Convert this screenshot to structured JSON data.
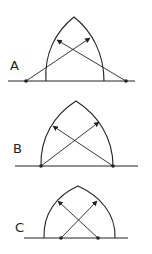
{
  "diagrams": [
    {
      "label": "A",
      "label_pos": [
        10,
        70
      ],
      "baseline": {
        "x1": 8,
        "x2": 135,
        "y": 81
      },
      "arch": {
        "left_base": [
          46,
          81
        ],
        "right_base": [
          104,
          81
        ],
        "apex": [
          74,
          17
        ]
      },
      "points": [
        [
          26,
          81
        ],
        [
          126,
          81
        ]
      ],
      "arrows": [
        {
          "from": [
            26,
            81
          ],
          "to": [
            90,
            38
          ]
        },
        {
          "from": [
            126,
            81
          ],
          "to": [
            57,
            40
          ]
        }
      ]
    },
    {
      "label": "B",
      "label_pos": [
        13,
        153
      ],
      "baseline": {
        "x1": 15,
        "x2": 138,
        "y": 166
      },
      "arch": {
        "left_base": [
          41,
          166
        ],
        "right_base": [
          113,
          166
        ],
        "apex": [
          76,
          101
        ]
      },
      "points": [
        [
          41,
          166
        ],
        [
          113,
          166
        ]
      ],
      "arrows": [
        {
          "from": [
            41,
            166
          ],
          "to": [
            99,
            122
          ]
        },
        {
          "from": [
            113,
            166
          ],
          "to": [
            53,
            126
          ]
        }
      ]
    },
    {
      "label": "C",
      "label_pos": [
        15,
        232
      ],
      "baseline": {
        "x1": 24,
        "x2": 128,
        "y": 238
      },
      "arch": {
        "left_base": [
          44,
          238
        ],
        "right_base": [
          115,
          238
        ],
        "apex": [
          78,
          186
        ]
      },
      "points": [
        [
          61,
          238
        ],
        [
          98,
          238
        ]
      ],
      "arrows": [
        {
          "from": [
            61,
            238
          ],
          "to": [
            97,
            201
          ]
        },
        {
          "from": [
            98,
            238
          ],
          "to": [
            58,
            201
          ]
        }
      ]
    }
  ],
  "colors": {
    "stroke": "#222222",
    "background": "#ffffff"
  }
}
